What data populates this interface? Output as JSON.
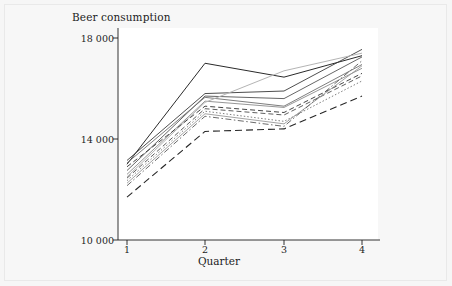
{
  "chart_data": {
    "type": "line",
    "title": "Beer consumption",
    "xlabel": "Quarter",
    "ylabel": "",
    "x": [
      1,
      2,
      3,
      4
    ],
    "xticklabels": [
      "1",
      "2",
      "3",
      "4"
    ],
    "yticklabels": [
      "10 000",
      "14 000",
      "18 000"
    ],
    "yticks": [
      10000,
      14000,
      18000
    ],
    "ylim": [
      10000,
      18000
    ],
    "xlim": [
      0.75,
      4.3
    ],
    "grid": false,
    "legend": false,
    "series": [
      {
        "name": "series-1",
        "values": [
          13000,
          17000,
          16450,
          17300
        ],
        "style": "solid",
        "color": "#2a2a2a",
        "width": 1.0
      },
      {
        "name": "series-2",
        "values": [
          13150,
          15800,
          15900,
          17550
        ],
        "style": "solid",
        "color": "#3a3a3a",
        "width": 0.9
      },
      {
        "name": "series-3",
        "values": [
          12750,
          15700,
          15600,
          17250
        ],
        "style": "solid",
        "color": "#555555",
        "width": 0.9
      },
      {
        "name": "series-4",
        "values": [
          13050,
          15650,
          15300,
          16950
        ],
        "style": "solid",
        "color": "#6e6e6e",
        "width": 0.9
      },
      {
        "name": "series-5",
        "values": [
          12600,
          15500,
          15250,
          16800
        ],
        "style": "solid",
        "color": "#8a8a8a",
        "width": 0.9
      },
      {
        "name": "series-6",
        "values": [
          12500,
          15450,
          16700,
          17400
        ],
        "style": "solid",
        "color": "#b4b4b4",
        "width": 1.0
      },
      {
        "name": "series-7",
        "values": [
          12900,
          15300,
          15050,
          16600
        ],
        "style": "dashed",
        "color": "#2f2f2f",
        "width": 0.9
      },
      {
        "name": "series-8",
        "values": [
          12450,
          15200,
          14950,
          16500
        ],
        "style": "dashed",
        "color": "#4d4d4d",
        "width": 0.9
      },
      {
        "name": "series-9",
        "values": [
          12350,
          15100,
          14700,
          16300
        ],
        "style": "dotted",
        "color": "#707070",
        "width": 0.9
      },
      {
        "name": "series-10",
        "values": [
          12250,
          15000,
          14600,
          16900
        ],
        "style": "solid",
        "color": "#999999",
        "width": 0.9
      },
      {
        "name": "series-11",
        "values": [
          12150,
          14900,
          14500,
          17100
        ],
        "style": "dashdot",
        "color": "#5a5a5a",
        "width": 0.9
      },
      {
        "name": "series-12",
        "values": [
          11700,
          14300,
          14400,
          15700
        ],
        "style": "dashed-long",
        "color": "#262626",
        "width": 1.1
      }
    ]
  },
  "axes": {
    "ytick_labels": [
      "18 000",
      "14 000",
      "10 000"
    ],
    "xtick_labels": [
      "1",
      "2",
      "3",
      "4"
    ],
    "xaxis_title": "Quarter"
  },
  "colors": {
    "page_background": "#f7f7f7",
    "plot_background": "#ffffff",
    "axis": "#1c1c1c",
    "text": "#1c1c1c"
  }
}
